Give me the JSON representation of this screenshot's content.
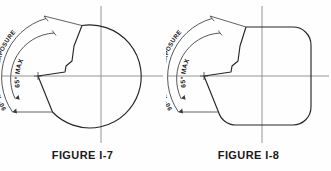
{
  "page": {
    "background_color": "#fefefe",
    "line_color": "#262626",
    "centerline_color": "#8a8a8a",
    "dimension_color": "#3a3a3a"
  },
  "figures": [
    {
      "id": "figure-i-7",
      "caption": "FIGURE I-7",
      "shape": "circle",
      "labels": {
        "outer": "90° MAXIMUM EXPOSURE",
        "inner": "65° MAX"
      },
      "dimensions": {
        "outer_angle_deg": 90,
        "inner_angle_deg": 65
      }
    },
    {
      "id": "figure-i-8",
      "caption": "FIGURE I-8",
      "shape": "rounded-square",
      "labels": {
        "outer": "90° MAXIMUM EXPOSURE",
        "inner": "65° MAX"
      },
      "dimensions": {
        "outer_angle_deg": 90,
        "inner_angle_deg": 65
      }
    }
  ]
}
